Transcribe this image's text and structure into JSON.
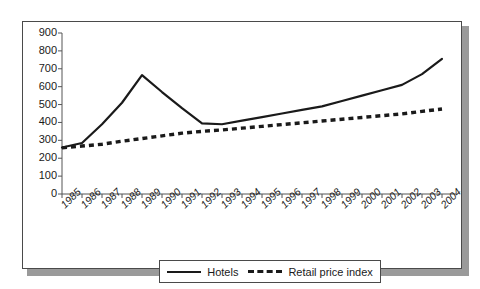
{
  "chart_data": {
    "type": "line",
    "title": "",
    "xlabel": "",
    "ylabel": "",
    "ylim": [
      0,
      900
    ],
    "ytick_step": 100,
    "grid": false,
    "legend_position": "bottom",
    "categories": [
      "1985",
      "1986",
      "1987",
      "1988",
      "1989",
      "1990",
      "1991",
      "1992",
      "1993",
      "1994",
      "1995",
      "1996",
      "1997",
      "1998",
      "1999",
      "2000",
      "2001",
      "2002",
      "2003",
      "2004"
    ],
    "yticks": [
      "0",
      "100",
      "200",
      "300",
      "400",
      "500",
      "600",
      "700",
      "800",
      "900"
    ],
    "series": [
      {
        "name": "Hotels",
        "style": "solid",
        "color": "#1a1a1a",
        "values": [
          260,
          285,
          390,
          510,
          665,
          570,
          480,
          395,
          390,
          410,
          430,
          450,
          470,
          490,
          520,
          550,
          580,
          610,
          670,
          755
        ]
      },
      {
        "name": "Retail price index",
        "style": "dashed",
        "color": "#1a1a1a",
        "values": [
          258,
          268,
          278,
          295,
          310,
          325,
          340,
          350,
          358,
          368,
          378,
          388,
          398,
          408,
          418,
          428,
          438,
          448,
          462,
          475
        ]
      }
    ]
  },
  "legend": {
    "entries": [
      {
        "label": "Hotels"
      },
      {
        "label": "Retail price index"
      }
    ]
  },
  "colors": {
    "line": "#1a1a1a",
    "frame": "#4a4a4a",
    "shadow": "#9a9a9a",
    "background": "#ffffff"
  }
}
